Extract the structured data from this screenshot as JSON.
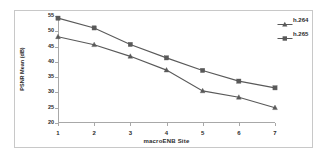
{
  "chart_data": {
    "type": "line",
    "title": "",
    "xlabel": "macroENB Site",
    "ylabel": "PSNR Mean (dB)",
    "categories": [
      "1",
      "2",
      "3",
      "4",
      "5",
      "6",
      "7"
    ],
    "x": [
      1,
      2,
      3,
      4,
      5,
      6,
      7
    ],
    "xlim": [
      1,
      7
    ],
    "ylim": [
      20,
      55
    ],
    "yticks": [
      20,
      25,
      30,
      35,
      40,
      45,
      50,
      55
    ],
    "ytick_labels": [
      "20",
      "25",
      "30",
      "35",
      "40",
      "45",
      "50",
      "55"
    ],
    "grid": false,
    "legend_position": "right",
    "series": [
      {
        "name": "h.264",
        "marker": "triangle",
        "color": "#595959",
        "values": [
          48.2,
          45.6,
          41.8,
          37.3,
          30.5,
          28.4,
          25.0
        ]
      },
      {
        "name": "h.265",
        "marker": "square",
        "color": "#595959",
        "values": [
          54.3,
          51.1,
          45.7,
          41.3,
          37.2,
          33.7,
          31.5
        ]
      }
    ]
  },
  "legend": {
    "entries": [
      {
        "label": "h.264",
        "marker": "triangle-marker-icon"
      },
      {
        "label": "h.265",
        "marker": "square-marker-icon"
      }
    ]
  },
  "colors": {
    "series_line": "#595959",
    "axis": "#a8a8a8",
    "text": "#2b2b2b",
    "frame": "#c8c8c8",
    "background": "#ffffff"
  }
}
